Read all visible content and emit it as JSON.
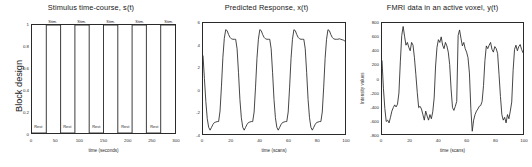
{
  "figure": {
    "background": "#ffffff",
    "line_color": "#262626",
    "axis_color": "#2a2a2a"
  },
  "panels": [
    {
      "id": "stimulus",
      "title": "Stimulus time-course, s(t)",
      "xlabel": "time (seconds)",
      "ylabel": "Block design",
      "xticks": [
        "0",
        "50",
        "100",
        "150",
        "200",
        "250",
        "300"
      ],
      "yticks": [
        "0",
        "0.2",
        "0.4",
        "0.6",
        "0.8",
        "1"
      ],
      "stim_label": "Stim.",
      "rest_label": "Rest"
    },
    {
      "id": "predicted",
      "title": "Predicted Response, x(t)",
      "xlabel": "time (scans)",
      "ylabel": "",
      "xticks": [
        "0",
        "20",
        "40",
        "60",
        "80",
        "100"
      ],
      "yticks": [
        "6",
        "4",
        "2",
        "0",
        "-2",
        "-4"
      ]
    },
    {
      "id": "fmri",
      "title": "FMRI data in an active voxel, y(t)",
      "xlabel": "time (scans)",
      "ylabel": "Intensity values",
      "xticks": [
        "0",
        "20",
        "40",
        "60",
        "80",
        "100"
      ],
      "yticks": [
        "800",
        "600",
        "400",
        "200",
        "0",
        "-200",
        "-400",
        "-600",
        "-800"
      ]
    }
  ],
  "chart_data": [
    {
      "type": "line",
      "id": "stimulus",
      "title": "Stimulus time-course, s(t)",
      "xlabel": "time (seconds)",
      "ylabel": "Block design",
      "xlim": [
        0,
        300
      ],
      "ylim": [
        0,
        1
      ],
      "grid": false,
      "legend": null,
      "description": "Boxcar block design: five 30 s stimulus blocks alternating with 30 s rest blocks over 300 s.",
      "block_duration_s": 30,
      "n_blocks": 5,
      "annotations": [
        {
          "text": "Stim.",
          "x": 45,
          "y": 1
        },
        {
          "text": "Stim.",
          "x": 105,
          "y": 1
        },
        {
          "text": "Stim.",
          "x": 165,
          "y": 1
        },
        {
          "text": "Stim.",
          "x": 225,
          "y": 1
        },
        {
          "text": "Stim.",
          "x": 285,
          "y": 1
        },
        {
          "text": "Rest",
          "x": 15,
          "y": 0
        },
        {
          "text": "Rest",
          "x": 75,
          "y": 0
        },
        {
          "text": "Rest",
          "x": 135,
          "y": 0
        },
        {
          "text": "Rest",
          "x": 195,
          "y": 0
        },
        {
          "text": "Rest",
          "x": 255,
          "y": 0
        }
      ],
      "x": [
        0,
        30,
        30,
        60,
        60,
        90,
        90,
        120,
        120,
        150,
        150,
        180,
        180,
        210,
        210,
        240,
        240,
        270,
        270,
        300
      ],
      "values": [
        0,
        0,
        1,
        1,
        0,
        0,
        1,
        1,
        0,
        0,
        1,
        1,
        0,
        0,
        1,
        1,
        0,
        0,
        1,
        1
      ]
    },
    {
      "type": "line",
      "id": "predicted",
      "title": "Predicted Response, x(t)",
      "xlabel": "time (scans)",
      "ylabel": "",
      "xlim": [
        0,
        100
      ],
      "ylim": [
        -5.6,
        6
      ],
      "grid": false,
      "legend": null,
      "description": "Boxcar convolved with a haemodynamic response function: rapid rise with initial overshoot peak near +5.3, plateau near +4.3, then fall with post-stimulus undershoot near -5.2 before settling near -4.3.",
      "x": [
        0,
        1,
        2,
        3,
        4,
        5,
        6,
        7,
        8,
        9,
        10,
        11,
        12,
        13,
        14,
        15,
        16,
        17,
        18,
        19,
        20,
        21,
        22,
        23,
        24,
        25,
        26,
        27,
        28,
        29,
        30,
        31,
        32,
        33,
        34,
        35,
        36,
        37,
        38,
        39,
        40,
        41,
        42,
        43,
        44,
        45,
        46,
        47,
        48,
        49,
        50,
        51,
        52,
        53,
        54,
        55,
        56,
        57,
        58,
        59,
        60,
        61,
        62,
        63,
        64,
        65,
        66,
        67,
        68,
        69,
        70,
        71,
        72,
        73,
        74,
        75,
        76,
        77,
        78,
        79,
        80,
        81,
        82,
        83,
        84,
        85,
        86,
        87,
        88,
        89,
        90,
        91,
        92,
        93,
        94,
        95,
        96,
        97,
        98,
        99,
        100
      ],
      "values": [
        2.6,
        0.2,
        -2.2,
        -4.0,
        -4.9,
        -5.2,
        -4.9,
        -4.6,
        -4.4,
        -4.35,
        -4.3,
        -4.3,
        -3.2,
        -0.6,
        2.4,
        4.4,
        5.3,
        5.2,
        4.8,
        4.5,
        4.35,
        4.3,
        4.3,
        4.3,
        3.3,
        0.8,
        -2.0,
        -3.9,
        -4.9,
        -5.2,
        -4.9,
        -4.6,
        -4.4,
        -4.35,
        -4.3,
        -4.3,
        -3.3,
        -0.7,
        2.3,
        4.3,
        5.3,
        5.2,
        4.8,
        4.5,
        4.35,
        4.3,
        4.3,
        4.3,
        3.3,
        0.8,
        -2.0,
        -3.9,
        -4.9,
        -5.2,
        -4.9,
        -4.6,
        -4.4,
        -4.35,
        -4.3,
        -4.3,
        -3.3,
        -0.7,
        2.3,
        4.3,
        5.3,
        5.2,
        4.8,
        4.5,
        4.35,
        4.3,
        4.3,
        4.3,
        3.3,
        0.8,
        -2.0,
        -3.9,
        -4.9,
        -5.2,
        -4.9,
        -4.6,
        -4.4,
        -4.35,
        -4.3,
        -4.3,
        -3.3,
        -0.7,
        2.3,
        4.3,
        5.3,
        5.2,
        4.8,
        4.5,
        4.35,
        4.3,
        4.3,
        4.3,
        4.35,
        4.3,
        4.25,
        4.2,
        4.1
      ]
    },
    {
      "type": "line",
      "id": "fmri",
      "title": "FMRI data in an active voxel, y(t)",
      "xlabel": "time (scans)",
      "ylabel": "Intensity values",
      "xlim": [
        0,
        100
      ],
      "ylim": [
        -800,
        800
      ],
      "grid": false,
      "legend": null,
      "description": "Measured BOLD signal from one active voxel: the predicted response plus measurement noise, peaking near +750 and dipping near -750.",
      "x": [
        0,
        1,
        2,
        3,
        4,
        5,
        6,
        7,
        8,
        9,
        10,
        11,
        12,
        13,
        14,
        15,
        16,
        17,
        18,
        19,
        20,
        21,
        22,
        23,
        24,
        25,
        26,
        27,
        28,
        29,
        30,
        31,
        32,
        33,
        34,
        35,
        36,
        37,
        38,
        39,
        40,
        41,
        42,
        43,
        44,
        45,
        46,
        47,
        48,
        49,
        50,
        51,
        52,
        53,
        54,
        55,
        56,
        57,
        58,
        59,
        60,
        61,
        62,
        63,
        64,
        65,
        66,
        67,
        68,
        69,
        70,
        71,
        72,
        73,
        74,
        75,
        76,
        77,
        78,
        79,
        80,
        81,
        82,
        83,
        84,
        85,
        86,
        87,
        88,
        89,
        90,
        91,
        92,
        93,
        94,
        95,
        96,
        97,
        98,
        99,
        100
      ],
      "values": [
        260,
        -140,
        -430,
        -620,
        -600,
        -640,
        -560,
        -470,
        -420,
        -380,
        -410,
        -370,
        -210,
        240,
        620,
        750,
        610,
        480,
        520,
        450,
        400,
        520,
        480,
        300,
        60,
        -200,
        -420,
        -400,
        -440,
        -520,
        -600,
        -470,
        -540,
        -600,
        -520,
        -580,
        -480,
        -280,
        180,
        450,
        560,
        520,
        600,
        480,
        430,
        520,
        470,
        380,
        200,
        -150,
        -420,
        -460,
        -400,
        -330,
        620,
        700,
        580,
        470,
        520,
        430,
        380,
        300,
        80,
        -430,
        -760,
        -600,
        -520,
        -470,
        -440,
        -400,
        -390,
        -330,
        -100,
        260,
        470,
        430,
        480,
        520,
        420,
        380,
        460,
        430,
        360,
        60,
        -260,
        -520,
        -600,
        -560,
        -640,
        -520,
        -580,
        -470,
        -340,
        120,
        420,
        480,
        400,
        460,
        490,
        420,
        370
      ]
    }
  ]
}
